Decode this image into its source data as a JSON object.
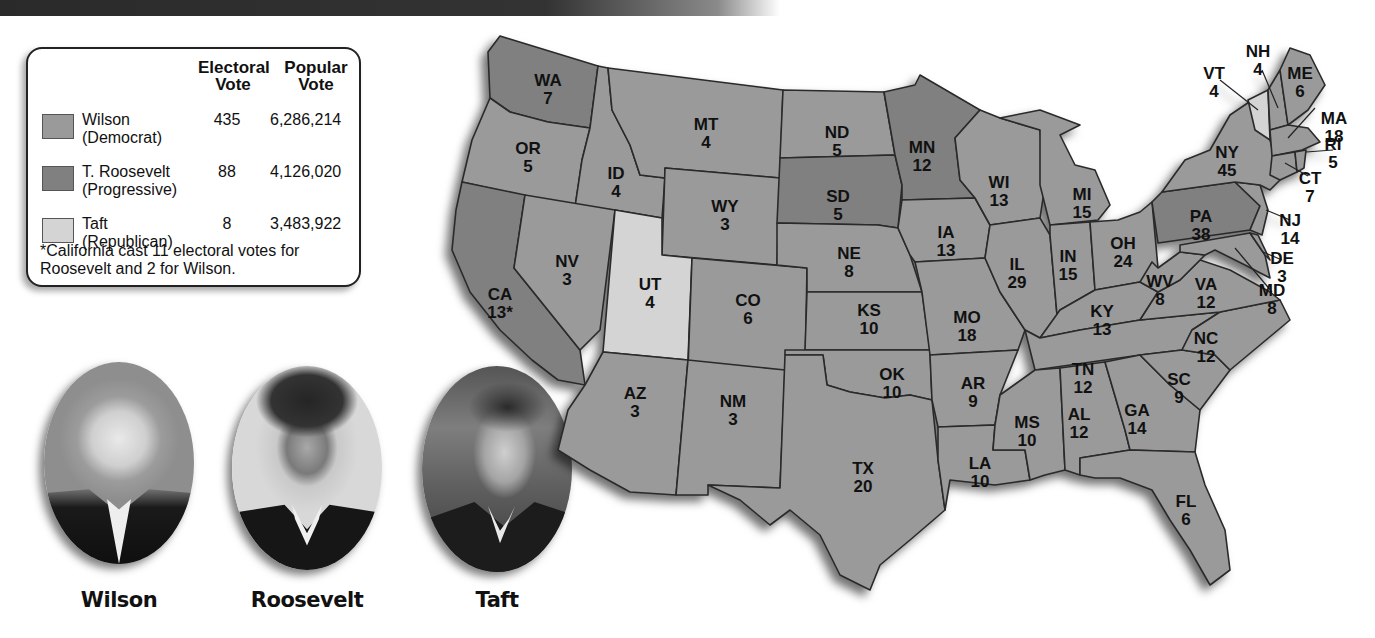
{
  "legend": {
    "headers": {
      "electoral": "Electoral\nVote",
      "popular": "Popular\nVote"
    },
    "rows": [
      {
        "name": "Wilson",
        "party": "(Democrat)",
        "electoral": "435",
        "popular": "6,286,214",
        "color": "#9a9a9a"
      },
      {
        "name": "T. Roosevelt",
        "party": "(Progressive)",
        "electoral": "88",
        "popular": "4,126,020",
        "color": "#808080"
      },
      {
        "name": "Taft",
        "party": "(Republican)",
        "electoral": "8",
        "popular": "3,483,922",
        "color": "#d4d4d4"
      }
    ],
    "note": "*California cast 11 electoral votes for Roosevelt and 2 for Wilson."
  },
  "portraits": [
    {
      "caption": "Wilson"
    },
    {
      "caption": "Roosevelt"
    },
    {
      "caption": "Taft"
    }
  ],
  "colors": {
    "wilson": "#9a9a9a",
    "roosevelt": "#808080",
    "taft": "#d4d4d4",
    "border": "#2a2a2a"
  },
  "states": [
    {
      "abbr": "WA",
      "votes": "7",
      "winner": "roosevelt",
      "x": 108,
      "y": 42
    },
    {
      "abbr": "OR",
      "votes": "5",
      "winner": "wilson",
      "x": 88,
      "y": 110
    },
    {
      "abbr": "CA",
      "votes": "13*",
      "winner": "roosevelt",
      "x": 60,
      "y": 256
    },
    {
      "abbr": "ID",
      "votes": "4",
      "winner": "wilson",
      "x": 176,
      "y": 135
    },
    {
      "abbr": "NV",
      "votes": "3",
      "winner": "wilson",
      "x": 127,
      "y": 223
    },
    {
      "abbr": "MT",
      "votes": "4",
      "winner": "wilson",
      "x": 266,
      "y": 86
    },
    {
      "abbr": "WY",
      "votes": "3",
      "winner": "wilson",
      "x": 285,
      "y": 168
    },
    {
      "abbr": "UT",
      "votes": "4",
      "winner": "taft",
      "x": 210,
      "y": 246
    },
    {
      "abbr": "CO",
      "votes": "6",
      "winner": "wilson",
      "x": 308,
      "y": 262
    },
    {
      "abbr": "AZ",
      "votes": "3",
      "winner": "wilson",
      "x": 195,
      "y": 355
    },
    {
      "abbr": "NM",
      "votes": "3",
      "winner": "wilson",
      "x": 293,
      "y": 363
    },
    {
      "abbr": "ND",
      "votes": "5",
      "winner": "wilson",
      "x": 397,
      "y": 94
    },
    {
      "abbr": "SD",
      "votes": "5",
      "winner": "roosevelt",
      "x": 398,
      "y": 158
    },
    {
      "abbr": "NE",
      "votes": "8",
      "winner": "wilson",
      "x": 409,
      "y": 215
    },
    {
      "abbr": "KS",
      "votes": "10",
      "winner": "wilson",
      "x": 429,
      "y": 272
    },
    {
      "abbr": "OK",
      "votes": "10",
      "winner": "wilson",
      "x": 452,
      "y": 336
    },
    {
      "abbr": "TX",
      "votes": "20",
      "winner": "wilson",
      "x": 423,
      "y": 430
    },
    {
      "abbr": "MN",
      "votes": "12",
      "winner": "roosevelt",
      "x": 482,
      "y": 109
    },
    {
      "abbr": "IA",
      "votes": "13",
      "winner": "wilson",
      "x": 506,
      "y": 194
    },
    {
      "abbr": "MO",
      "votes": "18",
      "winner": "wilson",
      "x": 527,
      "y": 279
    },
    {
      "abbr": "AR",
      "votes": "9",
      "winner": "wilson",
      "x": 533,
      "y": 345
    },
    {
      "abbr": "LA",
      "votes": "10",
      "winner": "wilson",
      "x": 540,
      "y": 425
    },
    {
      "abbr": "WI",
      "votes": "13",
      "winner": "wilson",
      "x": 559,
      "y": 144
    },
    {
      "abbr": "IL",
      "votes": "29",
      "winner": "wilson",
      "x": 577,
      "y": 226
    },
    {
      "abbr": "MI",
      "votes": "15",
      "winner": "wilson",
      "x": 642,
      "y": 156
    },
    {
      "abbr": "IN",
      "votes": "15",
      "winner": "wilson",
      "x": 628,
      "y": 218
    },
    {
      "abbr": "OH",
      "votes": "24",
      "winner": "wilson",
      "x": 683,
      "y": 205
    },
    {
      "abbr": "KY",
      "votes": "13",
      "winner": "wilson",
      "x": 662,
      "y": 273
    },
    {
      "abbr": "TN",
      "votes": "12",
      "winner": "wilson",
      "x": 643,
      "y": 331
    },
    {
      "abbr": "MS",
      "votes": "10",
      "winner": "wilson",
      "x": 587,
      "y": 384
    },
    {
      "abbr": "AL",
      "votes": "12",
      "winner": "wilson",
      "x": 639,
      "y": 376
    },
    {
      "abbr": "GA",
      "votes": "14",
      "winner": "wilson",
      "x": 697,
      "y": 372
    },
    {
      "abbr": "FL",
      "votes": "6",
      "winner": "wilson",
      "x": 746,
      "y": 463
    },
    {
      "abbr": "SC",
      "votes": "9",
      "winner": "wilson",
      "x": 739,
      "y": 341
    },
    {
      "abbr": "NC",
      "votes": "12",
      "winner": "wilson",
      "x": 766,
      "y": 300
    },
    {
      "abbr": "VA",
      "votes": "12",
      "winner": "wilson",
      "x": 766,
      "y": 246
    },
    {
      "abbr": "WV",
      "votes": "8",
      "winner": "wilson",
      "x": 720,
      "y": 243
    },
    {
      "abbr": "PA",
      "votes": "38",
      "winner": "roosevelt",
      "x": 761,
      "y": 178
    },
    {
      "abbr": "NY",
      "votes": "45",
      "winner": "wilson",
      "x": 787,
      "y": 114
    },
    {
      "abbr": "MD",
      "votes": "8",
      "winner": "wilson",
      "x": 832,
      "y": 252
    },
    {
      "abbr": "DE",
      "votes": "3",
      "winner": "wilson",
      "x": 842,
      "y": 220
    },
    {
      "abbr": "NJ",
      "votes": "14",
      "winner": "wilson",
      "x": 850,
      "y": 182
    },
    {
      "abbr": "CT",
      "votes": "7",
      "winner": "wilson",
      "x": 870,
      "y": 140
    },
    {
      "abbr": "RI",
      "votes": "5",
      "winner": "wilson",
      "x": 893,
      "y": 106
    },
    {
      "abbr": "MA",
      "votes": "18",
      "winner": "wilson",
      "x": 894,
      "y": 80
    },
    {
      "abbr": "ME",
      "votes": "6",
      "winner": "wilson",
      "x": 860,
      "y": 35
    },
    {
      "abbr": "NH",
      "votes": "4",
      "winner": "wilson",
      "x": 818,
      "y": 13
    },
    {
      "abbr": "VT",
      "votes": "4",
      "winner": "taft",
      "x": 774,
      "y": 35
    }
  ]
}
